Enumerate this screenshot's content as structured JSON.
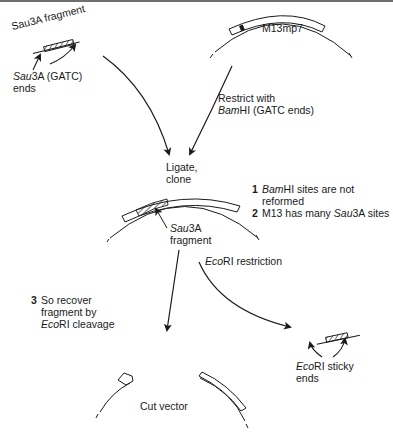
{
  "figure": {
    "labels": {
      "sau3a_fragment_title": "Sau3A fragment",
      "sau3a_ends_italic": "Sau",
      "sau3a_ends_rest": "3A (GATC)",
      "sau3a_ends_line2": "ends",
      "m13mp7": "M13mp7",
      "restrict_line1": "Restrict with",
      "restrict_italic": "Bam",
      "restrict_rest": "HI (GATC ends)",
      "ligate_line1": "Ligate,",
      "ligate_line2": "clone",
      "inserted_fragment_italic": "Sau",
      "inserted_fragment_rest": "3A",
      "inserted_fragment_line2": "fragment",
      "ecori_restriction_italic": "Eco",
      "ecori_restriction_rest": "RI restriction",
      "ecori_sticky_italic": "Eco",
      "ecori_sticky_rest": "RI sticky",
      "ecori_sticky_line2": "ends",
      "cut_vector": "Cut vector"
    },
    "notes": [
      {
        "number": "1",
        "italic": "Bam",
        "text": "HI sites are not",
        "line2": "reformed"
      },
      {
        "number": "2",
        "prefix": "M13 has many ",
        "italic": "Sau",
        "text": "3A sites"
      },
      {
        "number": "3",
        "line1": "So recover",
        "line2": "fragment by",
        "italic": "Eco",
        "line3_rest": "RI cleavage"
      }
    ],
    "colors": {
      "line": "#1a1a1a",
      "top_rule": "#6e6e6e",
      "background": "#ffffff"
    }
  }
}
